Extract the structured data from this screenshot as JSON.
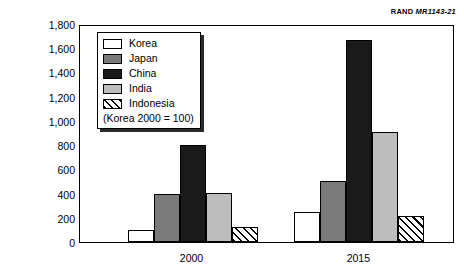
{
  "source_credit": {
    "org": "RAND",
    "code": "MR1143-21"
  },
  "axes": {
    "y_title": "Billions of PPP 1998 U.S. dollars",
    "y_ticks": [
      "0",
      "200",
      "400",
      "600",
      "800",
      "1,000",
      "1,200",
      "1,400",
      "1,600",
      "1,800"
    ],
    "x_ticks": [
      "2000",
      "2015"
    ]
  },
  "legend": {
    "items": [
      {
        "label": "Korea",
        "swatch": "white-swatch",
        "color": "#ffffff"
      },
      {
        "label": "Japan",
        "swatch": "dark-gray-swatch",
        "color": "#7a7a7a"
      },
      {
        "label": "China",
        "swatch": "black-swatch",
        "color": "#1a1a1a"
      },
      {
        "label": "India",
        "swatch": "light-gray-swatch",
        "color": "#bdbdbd"
      },
      {
        "label": "Indonesia",
        "swatch": "hatched-swatch",
        "color": "#ffffff"
      }
    ],
    "note": "(Korea 2000 = 100)"
  },
  "chart_data": {
    "type": "bar",
    "title": "",
    "xlabel": "",
    "ylabel": "Billions of PPP 1998 U.S. dollars",
    "categories": [
      "2000",
      "2015"
    ],
    "series": [
      {
        "name": "Korea",
        "values": [
          100,
          245
        ],
        "fill": "white"
      },
      {
        "name": "Japan",
        "values": [
          395,
          500
        ],
        "fill": "dark-gray"
      },
      {
        "name": "China",
        "values": [
          800,
          1670
        ],
        "fill": "black"
      },
      {
        "name": "India",
        "values": [
          405,
          910
        ],
        "fill": "light-gray"
      },
      {
        "name": "Indonesia",
        "values": [
          120,
          215
        ],
        "fill": "hatch"
      }
    ],
    "ylim": [
      0,
      1800
    ],
    "ytick_step": 200,
    "grid": false,
    "legend_position": "upper-left-inside",
    "annotation": "(Korea 2000 = 100)"
  }
}
